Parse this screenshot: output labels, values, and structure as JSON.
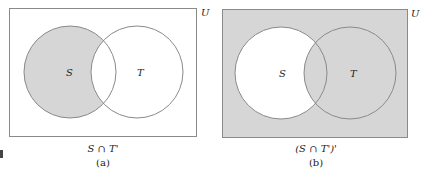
{
  "figure": {
    "panels": [
      {
        "id": "a",
        "universe_label": "U",
        "set_labels": [
          "S",
          "T"
        ],
        "expression": "S ∩ T'",
        "sublabel": "(a)",
        "shaded_region": "S minus T"
      },
      {
        "id": "b",
        "universe_label": "U",
        "set_labels": [
          "S",
          "T"
        ],
        "expression": "(S ∩ T')'",
        "sublabel": "(b)",
        "shaded_region": "complement of S minus T"
      }
    ],
    "colors": {
      "shade": "#d6d6d6",
      "stroke": "#8a8a8a",
      "background": "#ffffff"
    }
  }
}
